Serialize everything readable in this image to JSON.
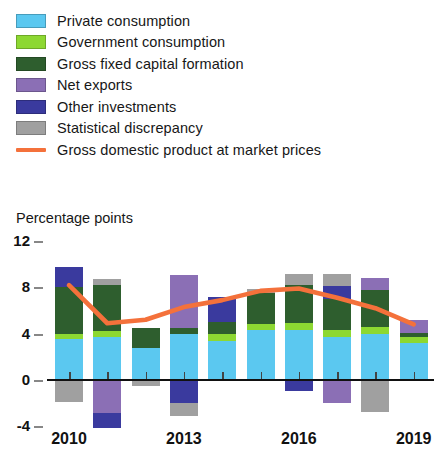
{
  "legend": {
    "items": [
      {
        "label": "Private consumption",
        "color": "#5BC8F0",
        "type": "swatch",
        "icon": "color-swatch"
      },
      {
        "label": "Government consumption",
        "color": "#8DD832",
        "type": "swatch",
        "icon": "color-swatch"
      },
      {
        "label": "Gross fixed capital formation",
        "color": "#2E5E2E",
        "type": "swatch",
        "icon": "color-swatch"
      },
      {
        "label": "Net exports",
        "color": "#8B6FB5",
        "type": "swatch",
        "icon": "color-swatch"
      },
      {
        "label": "Other investments",
        "color": "#3A3A9E",
        "type": "swatch",
        "icon": "color-swatch"
      },
      {
        "label": "Statistical discrepancy",
        "color": "#A0A0A0",
        "type": "swatch",
        "icon": "color-swatch"
      },
      {
        "label": "Gross domestic product at market prices",
        "color": "#F4713B",
        "type": "line",
        "icon": "line-swatch"
      }
    ]
  },
  "axis_title": "Percentage points",
  "chart_data": {
    "type": "bar",
    "title": "",
    "subtitle": "",
    "xlabel": "",
    "ylabel": "Percentage points",
    "ylim": [
      -4,
      12
    ],
    "yticks": [
      12,
      8,
      4,
      0,
      -4
    ],
    "ytick_labels": [
      "12",
      "8",
      "4",
      "0",
      "-4"
    ],
    "grid": false,
    "legend_position": "top",
    "stacked": true,
    "categories": [
      "2010",
      "2011",
      "2012",
      "2013",
      "2014",
      "2015",
      "2016",
      "2017",
      "2018",
      "2019"
    ],
    "xtick_labels": [
      "2010",
      "",
      "",
      "2013",
      "",
      "",
      "2016",
      "",
      "",
      "2019"
    ],
    "series": [
      {
        "name": "Private consumption",
        "color": "#5BC8F0",
        "values": [
          3.4,
          3.6,
          2.7,
          3.9,
          3.3,
          4.2,
          4.2,
          3.6,
          3.9,
          3.1
        ]
      },
      {
        "name": "Government consumption",
        "color": "#8DD832",
        "values": [
          0.5,
          0.5,
          0.0,
          0.0,
          0.6,
          0.5,
          0.6,
          0.6,
          0.6,
          0.5
        ]
      },
      {
        "name": "Gross fixed capital formation",
        "color": "#2E5E2E",
        "values": [
          4.0,
          4.0,
          1.7,
          0.5,
          1.0,
          2.7,
          3.3,
          2.7,
          3.2,
          0.4
        ]
      },
      {
        "name": "Net exports",
        "color": "#8B6FB5",
        "values": [
          0.0,
          -3.0,
          0.0,
          4.6,
          0.0,
          0.0,
          0.0,
          -2.1,
          1.0,
          1.1
        ]
      },
      {
        "name": "Other investments",
        "color": "#3A3A9E",
        "values": [
          1.8,
          -1.3,
          0.0,
          -2.1,
          2.2,
          0.0,
          -1.1,
          1.1,
          0.0,
          0.0
        ]
      },
      {
        "name": "Statistical discrepancy",
        "color": "#A0A0A0",
        "values": [
          -2.0,
          0.5,
          -0.6,
          -1.1,
          0.0,
          0.4,
          1.0,
          1.1,
          -2.9,
          0.0
        ]
      }
    ],
    "line_series": {
      "name": "Gross domestic product at market prices",
      "color": "#F4713B",
      "values": [
        8.1,
        4.8,
        5.1,
        6.2,
        6.8,
        7.6,
        7.8,
        7.0,
        6.1,
        4.7
      ]
    }
  }
}
